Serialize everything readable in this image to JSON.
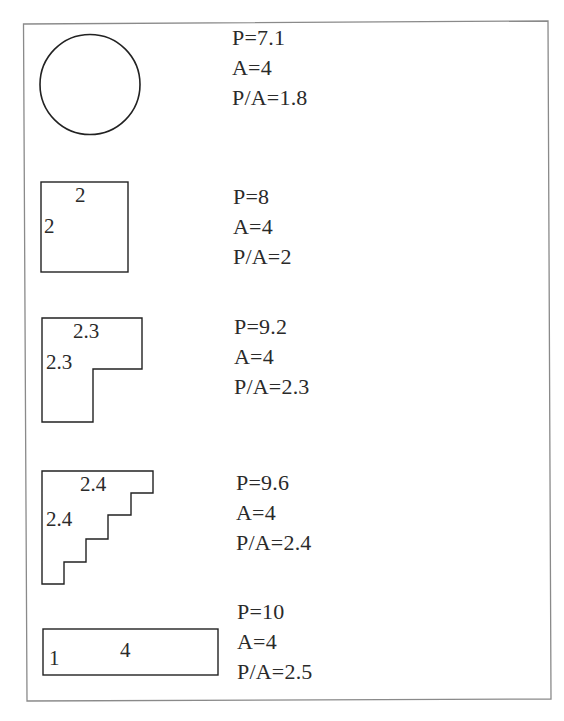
{
  "colors": {
    "frame": "#8a8a8a",
    "outline": "#222222",
    "text": "#2a2a2a",
    "background": "#ffffff"
  },
  "rows": [
    {
      "shape": "circle",
      "dims": {},
      "stats": {
        "perimeter": "P=7.1",
        "area": "A=4",
        "ratio": "P/A=1.8"
      }
    },
    {
      "shape": "square",
      "dims": {
        "top": "2",
        "side": "2"
      },
      "stats": {
        "perimeter": "P=8",
        "area": "A=4",
        "ratio": "P/A=2"
      }
    },
    {
      "shape": "l-shape",
      "dims": {
        "top": "2.3",
        "side": "2.3"
      },
      "stats": {
        "perimeter": "P=9.2",
        "area": "A=4",
        "ratio": "P/A=2.3"
      }
    },
    {
      "shape": "staircase",
      "dims": {
        "top": "2.4",
        "side": "2.4"
      },
      "stats": {
        "perimeter": "P=9.6",
        "area": "A=4",
        "ratio": "P/A=2.4"
      }
    },
    {
      "shape": "rectangle",
      "dims": {
        "top": "4",
        "side": "1"
      },
      "stats": {
        "perimeter": "P=10",
        "area": "A=4",
        "ratio": "P/A=2.5"
      }
    }
  ]
}
